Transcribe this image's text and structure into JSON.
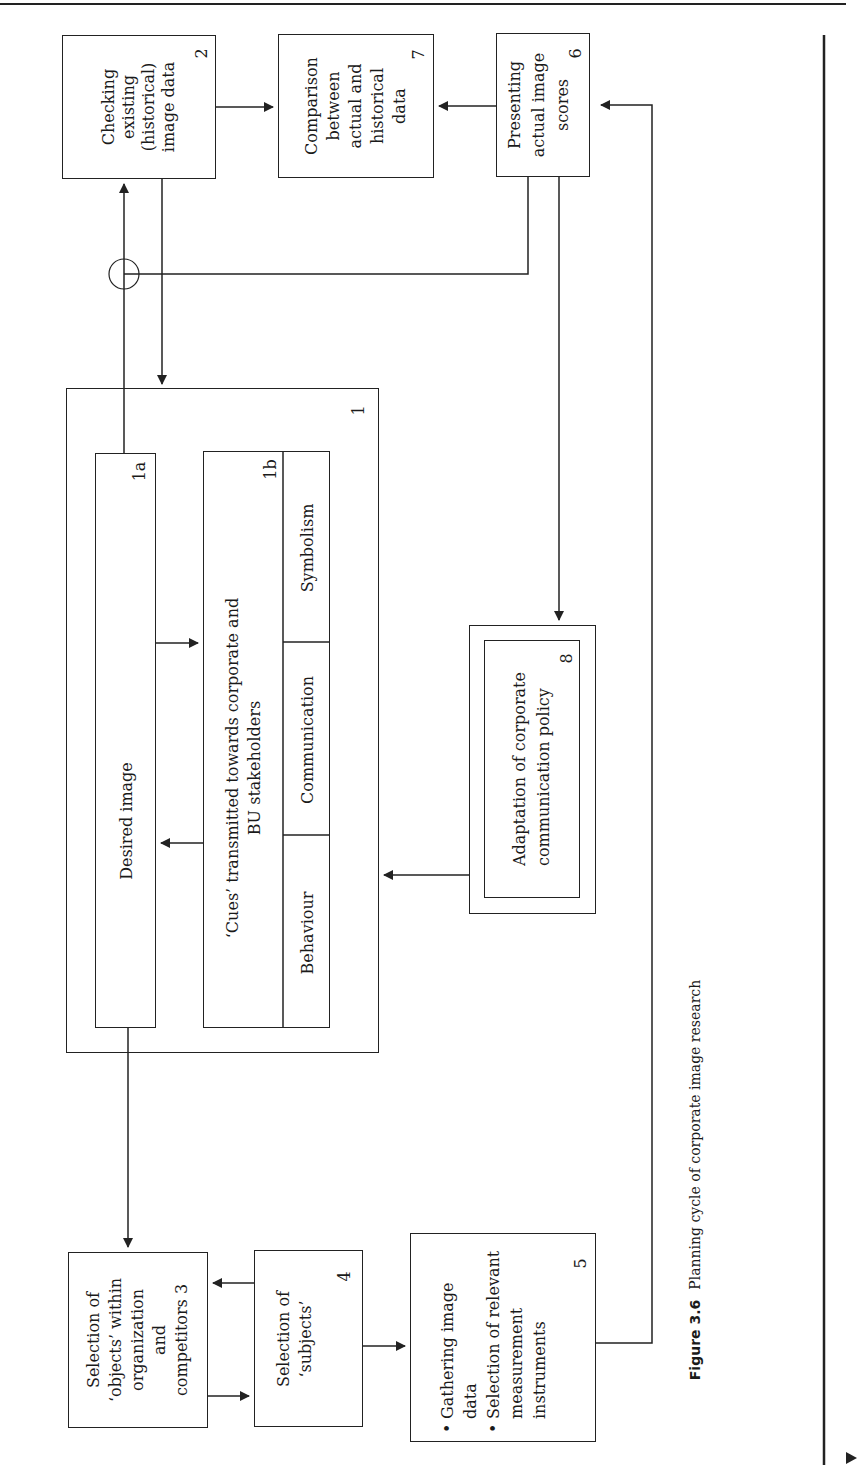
{
  "figure": {
    "label": "Figure 3.6",
    "caption": "Planning cycle of corporate image research"
  },
  "boxes": {
    "box1": {
      "number": "1"
    },
    "box1a": {
      "title": "Desired image",
      "number": "1a"
    },
    "box1b": {
      "title_line1": "‘Cues’ transmitted towards corporate and",
      "title_line2": "BU stakeholders",
      "number": "1b",
      "cells": [
        "Symbolism",
        "Communication",
        "Behaviour"
      ]
    },
    "box2": {
      "lines": [
        "Checking",
        "existing",
        "(historical)",
        "image data"
      ],
      "number": "2"
    },
    "box3": {
      "lines": [
        "Selection of",
        "‘objects’ within",
        "organization",
        "and",
        "competitors 3"
      ]
    },
    "box4": {
      "lines": [
        "Selection of",
        "‘subjects’"
      ],
      "number": "4"
    },
    "box5": {
      "bullets": [
        "Gathering image data",
        "Selection of relevant measurement instruments"
      ],
      "number": "5"
    },
    "box6": {
      "lines": [
        "Presenting",
        "actual image",
        "scores"
      ],
      "number": "6"
    },
    "box7": {
      "lines": [
        "Comparison",
        "between",
        "actual and",
        "historical",
        "data"
      ],
      "number": "7"
    },
    "box8": {
      "lines": [
        "Adaptation of corporate",
        "communication policy"
      ],
      "number": "8"
    }
  },
  "colors": {
    "line": "#222222",
    "background": "#ffffff"
  }
}
